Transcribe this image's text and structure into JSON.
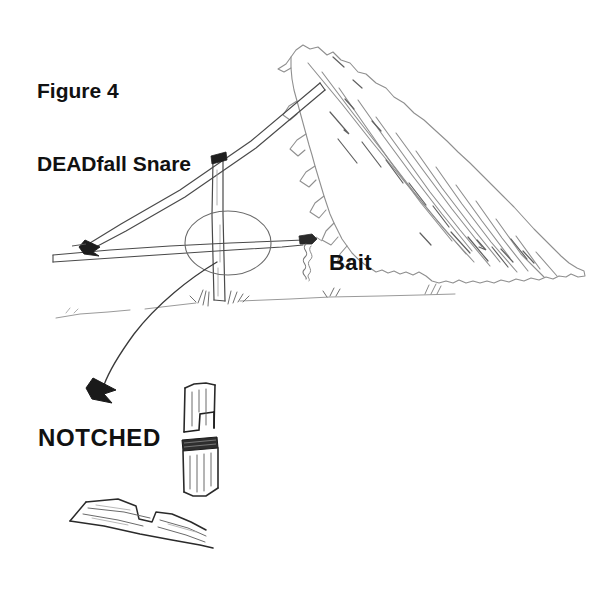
{
  "figure": {
    "title_line1": "Figure 4",
    "title_line2": "DEADfall Snare",
    "bait_label": "Bait",
    "notched_label": "NOTCHED"
  },
  "colors": {
    "background": "#ffffff",
    "text": "#111111",
    "sketch_dark": "#1a1a1a",
    "sketch_mid": "#555555",
    "sketch_light": "#8c8c8c",
    "sketch_faint": "#b8b8b8"
  },
  "drawing": {
    "elements": [
      "leaning-rock-slab",
      "diagonal-lever-stick",
      "vertical-support-post",
      "horizontal-bait-stick",
      "bait-lure",
      "trigger-highlight-ellipse",
      "ground-line",
      "grass-tufts",
      "curved-pointer-arrow",
      "notched-post-detail",
      "notched-stick-detail"
    ]
  }
}
